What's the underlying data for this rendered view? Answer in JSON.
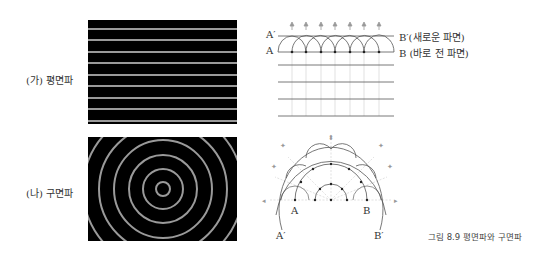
{
  "panels": {
    "plane": {
      "label": "(가) 평면파",
      "labels": {
        "a_prime": "A′",
        "a": "A",
        "b_prime": "B′(새로운 파면)",
        "b": "B (바로 전 파면)"
      }
    },
    "spherical": {
      "label": "(나) 구면파",
      "labels": {
        "a": "A",
        "b": "B",
        "a_prime": "A′",
        "b_prime": "B′"
      }
    }
  },
  "caption": "그림 8.9  평면파와 구면파",
  "colors": {
    "wave_bg": "#000000",
    "wave_line": "#9a9a9a",
    "diagram_line": "#555555",
    "arrow": "#8a8a8a"
  }
}
